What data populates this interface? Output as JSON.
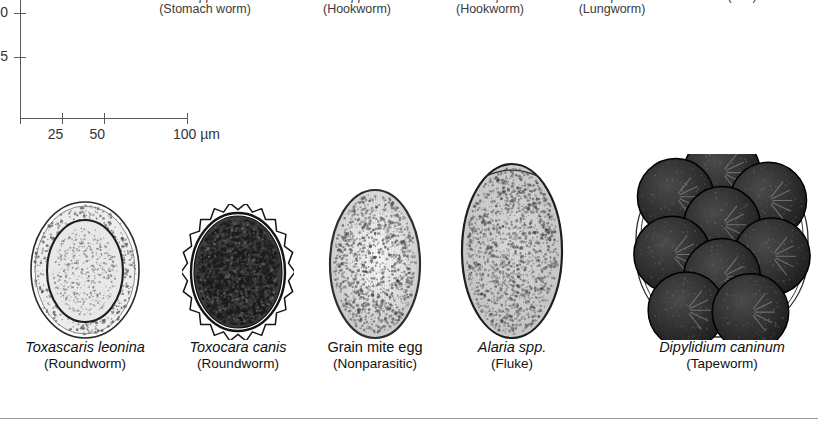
{
  "figure": {
    "kind": "parasite-egg-identification-plate",
    "scale_bar": {
      "x_ticks": [
        "25",
        "50",
        "100 µm"
      ],
      "x_tick_values": [
        25,
        50,
        100
      ],
      "y_ticks": [
        "0",
        "5"
      ],
      "unit": "µm"
    }
  },
  "top_labels": [
    {
      "sci": "spp.",
      "com": "(Stomach worm)",
      "center": 205
    },
    {
      "sci": "spp.",
      "com": "(Hookworm)",
      "center": 357
    },
    {
      "sci": "stenocephala",
      "com": "(Hookworm)",
      "center": 490
    },
    {
      "sci": "aerophila",
      "com": "(Lungworm)",
      "center": 612
    },
    {
      "sci": "",
      "com": "(ı ıııı)",
      "center": 742
    }
  ],
  "eggs": [
    {
      "id": "toxascaris-leonina",
      "sci": "Toxascaris leonina",
      "sci_italic": true,
      "com": "(Roundworm)",
      "center": 85,
      "width": 112,
      "height": 140,
      "style": "smooth-ring",
      "fill": "#e8e8e8",
      "stroke": "#2a2a2a"
    },
    {
      "id": "toxocara-canis",
      "sci": "Toxocara canis",
      "sci_italic": true,
      "com": "(Roundworm)",
      "center": 238,
      "width": 112,
      "height": 136,
      "style": "pitted-dark",
      "fill": "#3a3a3a",
      "stroke": "#151515"
    },
    {
      "id": "grain-mite-egg",
      "sci": "Grain mite egg",
      "sci_italic": false,
      "com": "(Nonparasitic)",
      "center": 375,
      "width": 94,
      "height": 152,
      "style": "smooth-oval",
      "fill": "#d7d7d7",
      "stroke": "#2f2f2f"
    },
    {
      "id": "alaria-spp",
      "sci": "Alaria spp.",
      "sci_italic": true,
      "com": "(Fluke)",
      "center": 512,
      "width": 104,
      "height": 178,
      "style": "operculate",
      "fill": "#cfcfcf",
      "stroke": "#1e1e1e"
    },
    {
      "id": "dipylidium-caninum",
      "sci": "Dipylidium caninum",
      "sci_italic": true,
      "com": "(Tapeworm)",
      "center": 722,
      "width": 178,
      "height": 186,
      "style": "egg-packet",
      "fill": "#2b2b2b",
      "stroke": "#111111",
      "packet_count": 9
    }
  ],
  "colors": {
    "background": "#ffffff",
    "text": "#222222",
    "axis": "#5a5a5a",
    "rule": "#9a9a9a"
  }
}
